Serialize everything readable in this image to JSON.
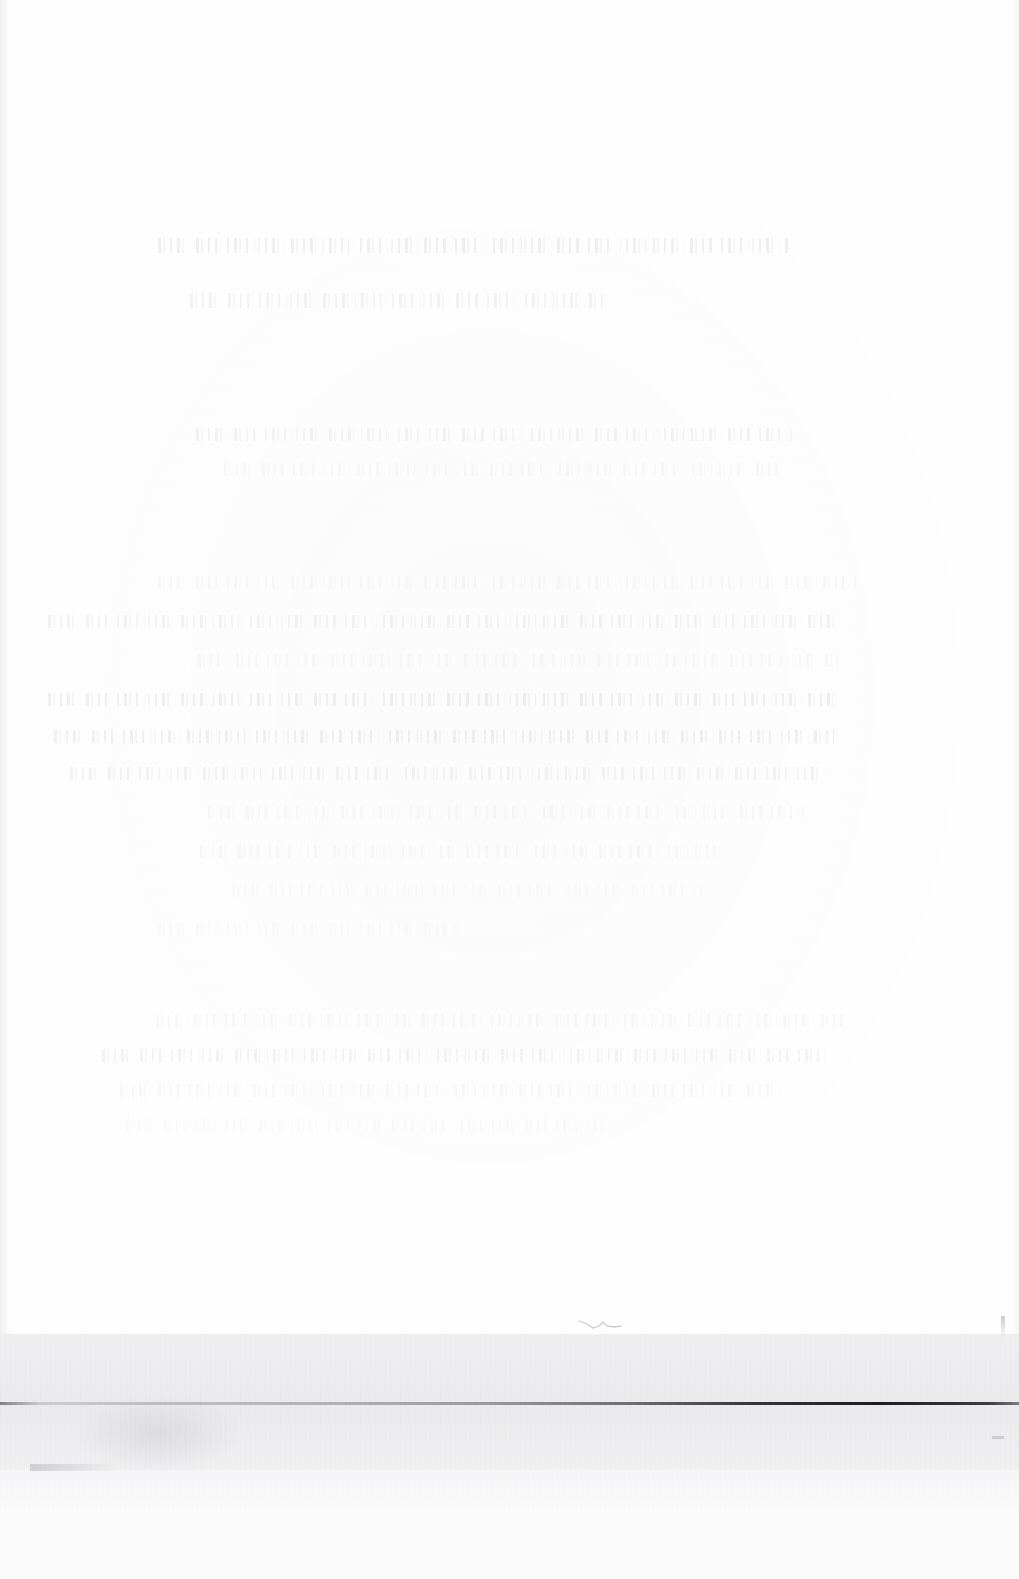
{
  "document": {
    "kind": "scanned-page",
    "legibility": "illegible",
    "description": "Severely faded scanned document page. All printed text has washed out to near-invisible ghost traces; no characters can be resolved.",
    "background_color": "#fefefe",
    "page_width": 1019,
    "page_height": 1579
  },
  "heading_block": {
    "name": "heading",
    "readable_text": "",
    "lines": [
      {
        "id": "heading-line-1",
        "text": "",
        "legible": false
      },
      {
        "id": "heading-line-2",
        "text": "",
        "legible": false
      }
    ]
  },
  "intro_block": {
    "name": "intro-paragraph",
    "readable_text": "",
    "lines": [
      {
        "id": "intro-line-1",
        "text": "",
        "legible": false
      },
      {
        "id": "intro-line-2",
        "text": "",
        "legible": false
      }
    ]
  },
  "body_block": {
    "name": "body-paragraph",
    "readable_text": "",
    "lines": [
      {
        "id": "body-line-1",
        "text": "",
        "legible": false
      },
      {
        "id": "body-line-2",
        "text": "",
        "legible": false
      },
      {
        "id": "body-line-3",
        "text": "",
        "legible": false
      },
      {
        "id": "body-line-4",
        "text": "",
        "legible": false
      },
      {
        "id": "body-line-5",
        "text": "",
        "legible": false
      },
      {
        "id": "body-line-6",
        "text": "",
        "legible": false
      },
      {
        "id": "body-line-7",
        "text": "",
        "legible": false
      },
      {
        "id": "body-line-8",
        "text": "",
        "legible": false
      },
      {
        "id": "body-line-9",
        "text": "",
        "legible": false
      },
      {
        "id": "body-line-10",
        "text": "",
        "legible": false
      }
    ]
  },
  "closing_block": {
    "name": "closing-paragraph",
    "readable_text": "",
    "lines": [
      {
        "id": "closing-line-1",
        "text": "",
        "legible": false
      },
      {
        "id": "closing-line-2",
        "text": "",
        "legible": false
      },
      {
        "id": "closing-line-3",
        "text": "",
        "legible": false
      },
      {
        "id": "closing-line-4",
        "text": "",
        "legible": false
      }
    ]
  },
  "scan_band": {
    "name": "scan-edge-band",
    "color": "#f4f4f5",
    "top": 1334,
    "height": 136,
    "rule": {
      "name": "dark-horizontal-rule",
      "color": "#14141c",
      "top": 1402,
      "note": "faint at left, darkest toward the right"
    },
    "artifacts": [
      {
        "id": "pen-squiggle",
        "type": "ink-mark"
      },
      {
        "id": "band-smudge",
        "type": "grey-smudge"
      },
      {
        "id": "band-nick",
        "type": "edge-nick"
      }
    ]
  },
  "bottom_strip": {
    "name": "lower-page-strip",
    "color": "#fbfbfc",
    "top": 1470,
    "height": 109
  }
}
